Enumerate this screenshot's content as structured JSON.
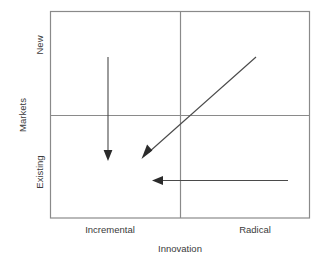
{
  "diagram": {
    "type": "2x2-matrix",
    "x_axis": {
      "title": "Innovation",
      "categories": [
        "Incremental",
        "Radical"
      ]
    },
    "y_axis": {
      "title": "Markets",
      "categories": [
        "Existing",
        "New"
      ]
    },
    "arrows": [
      {
        "name": "arrow-new-incremental-down",
        "direction": "down",
        "from": "New / Incremental",
        "to": "Existing / Incremental"
      },
      {
        "name": "arrow-radical-new-to-incremental-existing",
        "direction": "down-left",
        "from": "New / Radical",
        "to": "Existing / Incremental"
      },
      {
        "name": "arrow-radical-existing-to-incremental-existing",
        "direction": "left",
        "from": "Existing / Radical",
        "to": "Existing / Incremental"
      }
    ],
    "colors": {
      "frame": "#8a8a8a",
      "divider": "#8a8a8a",
      "arrow": "#3a3a3a",
      "text": "#3a3a3a",
      "background": "#ffffff"
    }
  }
}
